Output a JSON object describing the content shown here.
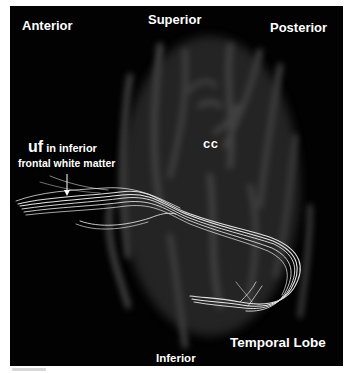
{
  "figure": {
    "background_color": "#020202",
    "tract_color": "#e6e6e6",
    "labels": {
      "anterior": "Anterior",
      "superior": "Superior",
      "posterior": "Posterior",
      "cc": "cc",
      "uf_abbrev": "uf",
      "uf_line1_rest": " in inferior",
      "uf_line2": "frontal white matter",
      "temporal_lobe": "Temporal Lobe",
      "inferior": "Inferior"
    },
    "annotations": {
      "arrow": "arrow-pointing-down-to-tract"
    }
  }
}
